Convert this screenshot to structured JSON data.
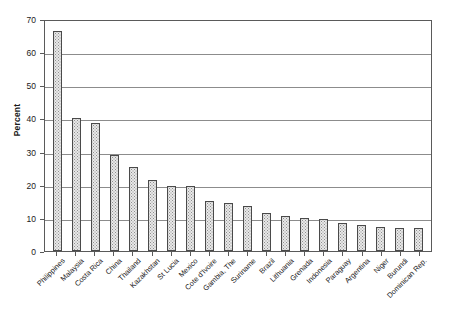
{
  "chart_data": {
    "type": "bar",
    "title": "",
    "xlabel": "",
    "ylabel": "Percent",
    "ylim": [
      0,
      70
    ],
    "yticks": [
      0,
      10,
      20,
      30,
      40,
      50,
      60,
      70
    ],
    "grid": true,
    "legend": false,
    "categories": [
      "Philippines",
      "Malaysia",
      "Costa Rica",
      "China",
      "Thailand",
      "Kazakhstan",
      "St Lucia",
      "Mexico",
      "Cote d'Ivoire",
      "Gambia, The",
      "Suriname",
      "Brazil",
      "Lithuania",
      "Grenada",
      "Indonesia",
      "Paraguay",
      "Argentina",
      "Niger",
      "Burundi",
      "Dominican Rep."
    ],
    "values": [
      66.5,
      40.0,
      38.5,
      29.0,
      25.5,
      21.5,
      19.5,
      19.5,
      15.0,
      14.5,
      13.5,
      11.5,
      10.5,
      10.0,
      9.8,
      8.5,
      8.0,
      7.2,
      7.0,
      6.8
    ],
    "colors": {
      "bar_fill": "#e8e8e8",
      "bar_pattern": "#8f8f8f",
      "bar_border": "#4a4a4a",
      "gridline": "#8c8c8c",
      "axis": "#5a5a5a",
      "text": "#1a1a1a",
      "background": "#ffffff"
    }
  }
}
